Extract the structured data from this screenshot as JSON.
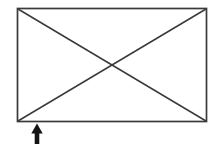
{
  "canvas": {
    "width": 220,
    "height": 144,
    "background": "#ffffff"
  },
  "diagram": {
    "line_color": "#3a3a3a",
    "arrow_color": "#141414",
    "shapes": [
      {
        "kind": "rect",
        "name": "rectangle-outline",
        "x": 17.5,
        "y": 8.5,
        "width": 189,
        "height": 113,
        "stroke": "#3a3a3a",
        "strokeWidth": 1.7,
        "fill": "none"
      },
      {
        "kind": "line",
        "name": "diagonal-topleft-bottomright",
        "x1": 18,
        "y1": 9,
        "x2": 206,
        "y2": 121,
        "stroke": "#3a3a3a",
        "strokeWidth": 1.5
      },
      {
        "kind": "line",
        "name": "diagonal-bottomleft-topright",
        "x1": 18,
        "y1": 121,
        "x2": 206,
        "y2": 9,
        "stroke": "#3a3a3a",
        "strokeWidth": 1.5
      },
      {
        "kind": "polygon",
        "name": "up-arrow-icon",
        "points": "37,123.5 31.3,133.5 34.7,133.5 34.7,144 39.3,144 39.3,133.5 42.7,133.5",
        "fill": "#141414"
      }
    ]
  }
}
